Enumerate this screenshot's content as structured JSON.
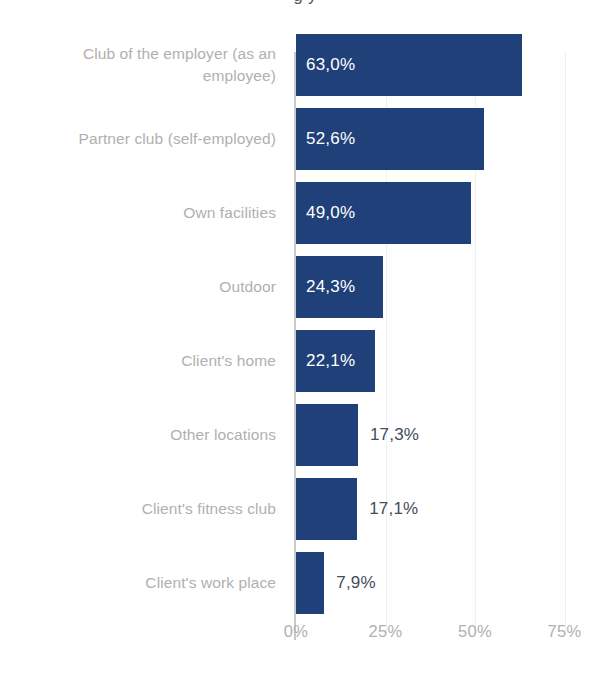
{
  "title_partial": "g                                                                                                    y",
  "colors": {
    "bar": "#1f4078",
    "label_inside": "#ffffff",
    "label_outside": "#434c5e",
    "category_label": "#b0b0b0",
    "axis_line": "#c9c9c9",
    "gridline": "#f0f0f2",
    "background": "#ffffff"
  },
  "chart_data": {
    "type": "bar",
    "orientation": "horizontal",
    "title": "",
    "xlabel": "",
    "ylabel": "",
    "xlim": [
      0,
      78
    ],
    "grid": true,
    "legend": "none",
    "tick_labels": [
      "0%",
      "25%",
      "50%",
      "75%"
    ],
    "tick_values": [
      0,
      25,
      50,
      75
    ],
    "categories": [
      "Club of the employer (as an employee)",
      "Partner club (self-employed)",
      "Own facilities",
      "Outdoor",
      "Client's home",
      "Other locations",
      "Client's fitness club",
      "Client's work place"
    ],
    "values": [
      63.0,
      52.6,
      49.0,
      24.3,
      22.1,
      17.3,
      17.1,
      7.9
    ],
    "value_labels": [
      "63,0%",
      "52,6%",
      "49,0%",
      "24,3%",
      "22,1%",
      "17,3%",
      "17,1%",
      "7,9%"
    ],
    "label_position": [
      "inside",
      "inside",
      "inside",
      "inside",
      "inside",
      "outside",
      "outside",
      "outside"
    ]
  }
}
